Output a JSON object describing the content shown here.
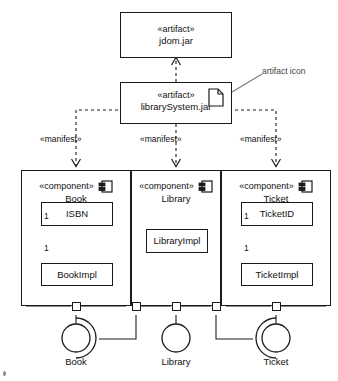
{
  "diagram": {
    "notation": "UML",
    "annotation": {
      "text": "artifact icon",
      "icon_name": "artifact-document-icon"
    },
    "artifacts": [
      {
        "id": "jdom",
        "stereotype": "«artifact»",
        "name": "jdom.jar",
        "has_icon": false
      },
      {
        "id": "librarysystem",
        "stereotype": "«artifact»",
        "name": "librarySystem.jar",
        "has_icon": true
      }
    ],
    "dependency": {
      "label": "",
      "from": "librarySystem.jar",
      "to": "jdom.jar",
      "style": "dashed-open-arrow"
    },
    "manifest_label": "«manifest»",
    "manifests": [
      {
        "label": "«manifest»",
        "target": "Book"
      },
      {
        "label": "«manifest»",
        "target": "Library"
      },
      {
        "label": "«manifest»",
        "target": "Ticket"
      }
    ],
    "components": [
      {
        "id": "book",
        "stereotype": "«component»",
        "name": "Book",
        "icon_name": "component-icon",
        "interface_class": "ISBN",
        "impl_class": "BookImpl",
        "composition": {
          "source_multiplicity": "1",
          "target_multiplicity": "1",
          "kind": "composition-with-generalization"
        },
        "ports": 1
      },
      {
        "id": "library",
        "stereotype": "«component»",
        "name": "Library",
        "icon_name": "component-icon",
        "interface_class": "",
        "impl_class": "LibraryImpl",
        "composition": null,
        "ports": 3
      },
      {
        "id": "ticket",
        "stereotype": "«component»",
        "name": "Ticket",
        "icon_name": "component-icon",
        "interface_class": "TicketID",
        "impl_class": "TicketImpl",
        "composition": {
          "source_multiplicity": "1",
          "target_multiplicity": "1",
          "kind": "composition-with-generalization"
        },
        "ports": 1
      }
    ],
    "interfaces": [
      {
        "id": "book-interface",
        "label": "Book",
        "provided": true,
        "required": true,
        "socket_opens": "right"
      },
      {
        "id": "library-interface",
        "label": "Library",
        "provided": true,
        "required": false,
        "socket_opens": ""
      },
      {
        "id": "ticket-interface",
        "label": "Ticket",
        "provided": true,
        "required": true,
        "socket_opens": "left"
      }
    ]
  },
  "colors": {
    "stroke": "#1a1a1a",
    "fill": "#ffffff",
    "annotation": "#444444"
  }
}
